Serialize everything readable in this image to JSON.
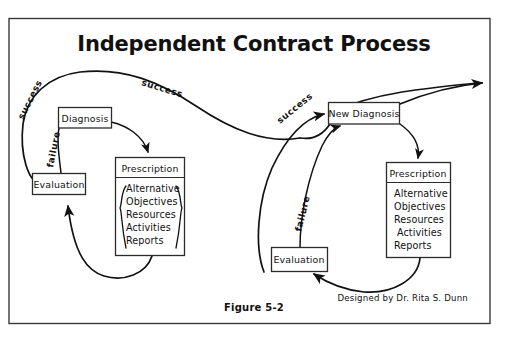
{
  "figure": {
    "title": "Independent Contract Process",
    "caption": "Figure 5-2",
    "credit": "Designed by Dr. Rita S. Dunn",
    "border_color": "#3a3a3a",
    "ink_color": "#111111",
    "background": "#ffffff"
  },
  "nodes": {
    "diagnosis": {
      "label": "Diagnosis"
    },
    "evaluation_left": {
      "label": "Evaluation"
    },
    "prescription_left": {
      "header": "Prescription",
      "items": [
        "Alternative",
        "Objectives",
        "Resources",
        "Activities",
        "Reports"
      ],
      "has_braces": true
    },
    "new_diagnosis": {
      "label": "New Diagnosis"
    },
    "evaluation_right": {
      "label": "Evaluation"
    },
    "prescription_right": {
      "header": "Prescription",
      "items": [
        "Alternative",
        "Objectives",
        "Resources",
        "Activities",
        "Reports"
      ],
      "has_braces": false
    }
  },
  "edges": [
    {
      "id": "success-left-loop",
      "label": "success",
      "from": "evaluation_left",
      "to": "new_diagnosis"
    },
    {
      "id": "success-mid",
      "label": "success",
      "from": "evaluation_left",
      "to": "new_diagnosis"
    },
    {
      "id": "failure-left",
      "label": "failure",
      "from": "evaluation_left",
      "to": "diagnosis"
    },
    {
      "id": "success-right",
      "label": "success",
      "from": "evaluation_right",
      "to": "new_diagnosis"
    },
    {
      "id": "failure-right",
      "label": "failure",
      "from": "evaluation_right",
      "to": "new_diagnosis"
    },
    {
      "id": "diagnosis-to-prescription",
      "label": "",
      "from": "diagnosis",
      "to": "prescription_left"
    },
    {
      "id": "prescription-to-evaluation",
      "label": "",
      "from": "prescription_left",
      "to": "evaluation_left"
    },
    {
      "id": "newdiagnosis-to-prescription",
      "label": "",
      "from": "new_diagnosis",
      "to": "prescription_right"
    },
    {
      "id": "prescription-to-evaluation-right",
      "label": "",
      "from": "prescription_right",
      "to": "evaluation_right"
    },
    {
      "id": "success-exit",
      "label": "",
      "from": "new_diagnosis",
      "to": ""
    }
  ]
}
